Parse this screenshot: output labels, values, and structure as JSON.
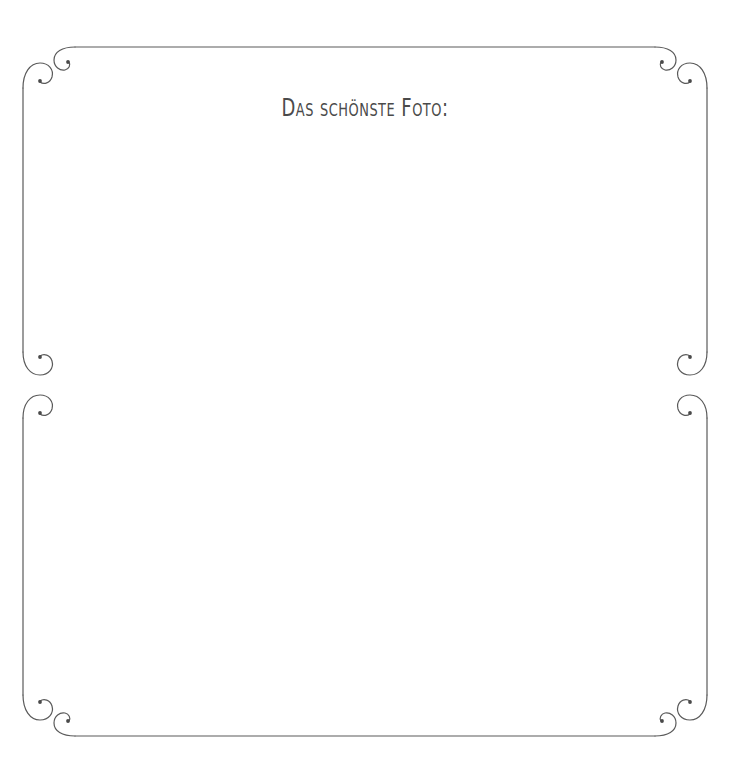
{
  "page": {
    "width": 730,
    "height": 772,
    "background_color": "#ffffff",
    "kind": "scrapbook-photo-page"
  },
  "title": {
    "text": "Das schönste Foto:",
    "color": "#4a4a4a",
    "align": "center"
  },
  "frame": {
    "name": "decorative-border",
    "stroke_color": "#5a5a5a",
    "stroke_width": 1.2,
    "left_x": 23,
    "right_x": 707,
    "top_y": 47,
    "bottom_y": 736,
    "has_side_breaks": true,
    "side_break_y": 385
  },
  "ornaments": {
    "description": "hand-drawn spiral flourishes terminating each border line",
    "count": 12,
    "spiral_radius": 9,
    "terminal_dot_radius": 1.8,
    "corners": [
      {
        "name": "ornament-top-left",
        "x": 23,
        "y": 47
      },
      {
        "name": "ornament-top-right",
        "x": 707,
        "y": 47
      },
      {
        "name": "ornament-bottom-left",
        "x": 23,
        "y": 736
      },
      {
        "name": "ornament-bottom-right",
        "x": 707,
        "y": 736
      }
    ],
    "side_breaks": [
      {
        "name": "ornament-left-middle",
        "x": 23,
        "y": 385
      },
      {
        "name": "ornament-right-middle",
        "x": 707,
        "y": 385
      }
    ]
  },
  "photo_area": {
    "name": "photo-placeholder",
    "label": ""
  }
}
